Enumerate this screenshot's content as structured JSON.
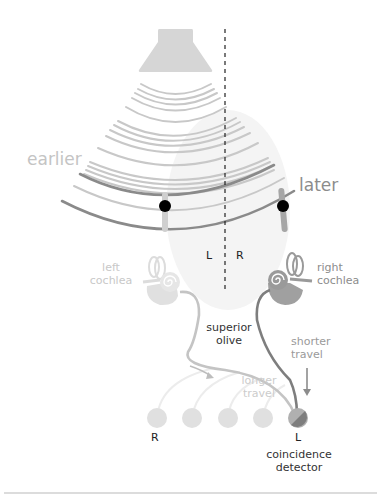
{
  "diagram": {
    "title_labels": {
      "earlier": "earlier",
      "later": "later",
      "left_side": "L",
      "right_side": "R"
    },
    "cochleae": {
      "left": {
        "line1": "left",
        "line2": "cochlea"
      },
      "right": {
        "line1": "right",
        "line2": "cochlea"
      }
    },
    "nuclei": {
      "superior_olive": {
        "line1": "superior",
        "line2": "olive"
      }
    },
    "paths": {
      "shorter": {
        "line1": "shorter",
        "line2": "travel"
      },
      "longer": {
        "line1": "longer",
        "line2": "travel"
      }
    },
    "detectors": {
      "count": 5,
      "left_end_label": "R",
      "right_end_label": "L",
      "caption_line1": "coincidence",
      "caption_line2": "detector"
    },
    "colors": {
      "speaker": "#d6d6d6",
      "wave_light": "#c8c8c8",
      "wave_dark": "#8a8a8a",
      "dot": "#000000",
      "label_faint": "#c4c4c4",
      "label_mid": "#8c8c8c",
      "label_dark": "#333333",
      "left_cochlea": "#dcdcdc",
      "right_cochlea": "#9a9a9a",
      "detector_idle": "#e0e0e0",
      "detector_active_light": "#b0b0b0",
      "detector_active_dark": "#7e7e7e"
    }
  }
}
